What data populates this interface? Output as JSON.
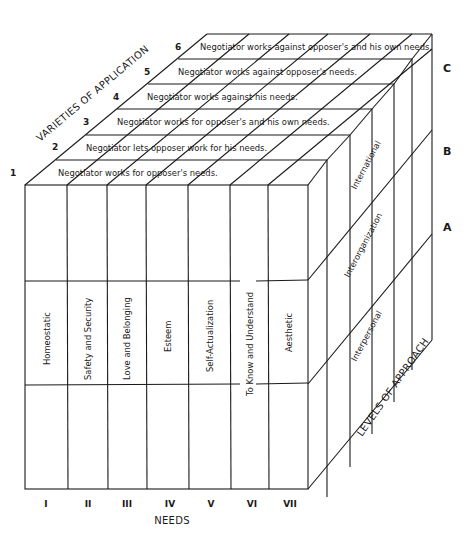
{
  "diagram": {
    "axes": {
      "varieties_label": "VARIETIES OF APPLICATION",
      "levels_label": "LEVELS OF APPROACH",
      "needs_label": "NEEDS"
    },
    "varieties": [
      {
        "num": "1",
        "text": "Negotiator works for opposer's needs."
      },
      {
        "num": "2",
        "text": "Negotiator lets opposer work for his needs."
      },
      {
        "num": "3",
        "text": "Negotiator works for opposer's and his own needs."
      },
      {
        "num": "4",
        "text": "Negotiator works against his needs."
      },
      {
        "num": "5",
        "text": "Negotiator works against opposer's needs."
      },
      {
        "num": "6",
        "text": "Negotiator works against opposer's and his own needs."
      }
    ],
    "needs": [
      {
        "num": "I",
        "text": "Homeostatic"
      },
      {
        "num": "II",
        "text": "Safety and Security"
      },
      {
        "num": "III",
        "text": "Love and Belonging"
      },
      {
        "num": "IV",
        "text": "Esteem"
      },
      {
        "num": "V",
        "text": "Self-Actualization"
      },
      {
        "num": "VI",
        "text": "To Know and Understand"
      },
      {
        "num": "VII",
        "text": "Aesthetic"
      }
    ],
    "levels": [
      {
        "letter": "A",
        "text": "Interpersonal"
      },
      {
        "letter": "B",
        "text": "Interorganization"
      },
      {
        "letter": "C",
        "text": "International"
      }
    ]
  }
}
